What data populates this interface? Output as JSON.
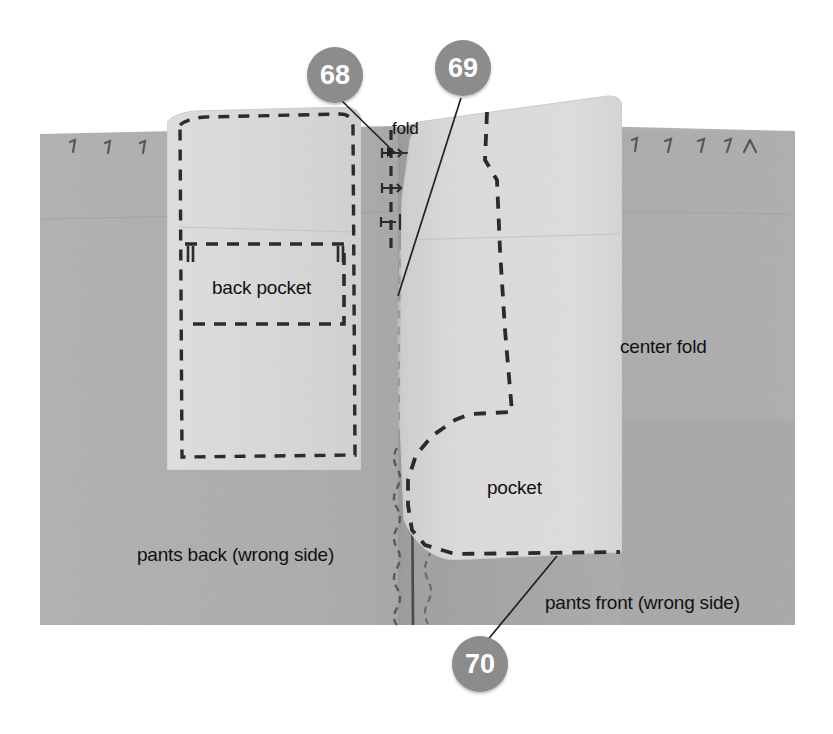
{
  "image": {
    "kind": "sewing-instruction-photograph",
    "width": 833,
    "height": 734,
    "background_color": "#ffffff"
  },
  "colors": {
    "page_background": "#ffffff",
    "fabric_gray": "#b1b1b1",
    "fabric_gray_dark": "#a2a2a2",
    "pattern_paper_light": "#dcdcdc",
    "pattern_paper_light2": "#d4d4d4",
    "callout_fill": "#8c8c8c",
    "callout_text": "#ffffff",
    "marking_line": "#2b2b2b",
    "leader_line": "#222222",
    "text_color": "#111111"
  },
  "callouts": [
    {
      "id": "callout-68",
      "number": "68",
      "x": 335,
      "y": 75,
      "leader_to": {
        "x": 393,
        "y": 150
      }
    },
    {
      "id": "callout-69",
      "number": "69",
      "x": 463,
      "y": 68,
      "leader_to": {
        "x": 398,
        "y": 295
      }
    },
    {
      "id": "callout-70",
      "number": "70",
      "x": 480,
      "y": 664,
      "leader_to": {
        "x": 556,
        "y": 556
      }
    }
  ],
  "labels": [
    {
      "id": "label-fold",
      "text": "fold",
      "x": 392,
      "y": 120,
      "size": "small"
    },
    {
      "id": "label-back-pocket",
      "text": "back pocket",
      "x": 212,
      "y": 278,
      "size": "normal"
    },
    {
      "id": "label-center-fold",
      "text": "center fold",
      "x": 620,
      "y": 337,
      "size": "normal"
    },
    {
      "id": "label-pocket",
      "text": "pocket",
      "x": 487,
      "y": 478,
      "size": "normal"
    },
    {
      "id": "label-pants-back",
      "text": "pants back (wrong side)",
      "x": 137,
      "y": 545,
      "size": "normal"
    },
    {
      "id": "label-pants-front",
      "text": "pants front (wrong side)",
      "x": 545,
      "y": 593,
      "size": "normal"
    }
  ],
  "fabric": {
    "left_edge": 40,
    "right_edge": 795,
    "top_edge": 126,
    "bottom_edge": 625,
    "horizontal_crease_y": 216
  },
  "pattern_pieces": [
    {
      "id": "back-pocket-piece",
      "label": "back pocket",
      "left": 163,
      "top": 113,
      "right": 362,
      "bottom": 470
    },
    {
      "id": "front-pocket-piece",
      "label": "pocket",
      "left": 398,
      "top": 96,
      "right": 622,
      "bottom": 560
    }
  ],
  "markings": {
    "fold_arrows_count": 3,
    "pin_marks_left_count": 5,
    "pin_marks_right_count": 5,
    "center_seam_stitch": "zigzag"
  }
}
